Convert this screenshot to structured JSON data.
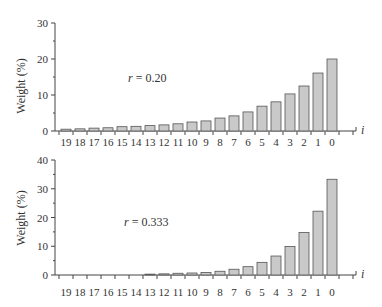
{
  "style": {
    "bar_fill": "#c9c9c9",
    "bar_stroke": "#555555",
    "axis_color": "#444444",
    "text_color": "#333333"
  },
  "chart_data": [
    {
      "type": "bar",
      "title": "",
      "xlabel": "i",
      "ylabel": "Weight (%)",
      "ylim": [
        0,
        30
      ],
      "yticks": [
        0,
        10,
        20,
        30
      ],
      "grid": false,
      "legend": null,
      "annotation": {
        "var": "r",
        "text": " = 0.20"
      },
      "categories": [
        "19",
        "18",
        "17",
        "16",
        "15",
        "14",
        "13",
        "12",
        "11",
        "10",
        "9",
        "8",
        "7",
        "6",
        "5",
        "4",
        "3",
        "2",
        "1",
        "0"
      ],
      "values": [
        0.5,
        0.6,
        0.8,
        0.9,
        1.2,
        1.3,
        1.5,
        1.7,
        2.0,
        2.5,
        2.8,
        3.6,
        4.2,
        5.3,
        6.9,
        8.1,
        10.3,
        12.5,
        16.1,
        20.0
      ]
    },
    {
      "type": "bar",
      "title": "",
      "xlabel": "i",
      "ylabel": "Weight (%)",
      "ylim": [
        0,
        40
      ],
      "yticks": [
        0,
        10,
        20,
        30,
        40
      ],
      "grid": false,
      "legend": null,
      "annotation": {
        "var": "r",
        "text": " = 0.333"
      },
      "categories": [
        "19",
        "18",
        "17",
        "16",
        "15",
        "14",
        "13",
        "12",
        "11",
        "10",
        "9",
        "8",
        "7",
        "6",
        "5",
        "4",
        "3",
        "2",
        "1",
        "0"
      ],
      "values": [
        0,
        0,
        0,
        0,
        0,
        0,
        0.3,
        0.4,
        0.6,
        0.7,
        0.9,
        1.3,
        2.0,
        2.9,
        4.4,
        6.6,
        9.9,
        14.8,
        22.2,
        33.3
      ]
    }
  ]
}
